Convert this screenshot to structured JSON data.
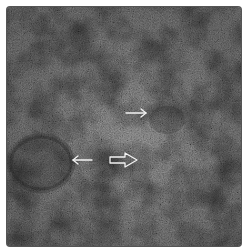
{
  "image": {
    "kind": "grayscale micrograph",
    "texture": "dense granular noise",
    "colors": {
      "background": "#ffffff",
      "base_gray": "#6f6f6f",
      "dark_region": "#3e3e3e",
      "light_region": "#8a8a8a",
      "arrow": "#f2f2f2"
    }
  },
  "annotations": {
    "arrows": [
      {
        "name": "arrow-right-upper",
        "type": "thin",
        "direction": "right",
        "from": [
          126,
          113
        ],
        "to": [
          146,
          113
        ]
      },
      {
        "name": "arrow-left-lower",
        "type": "thin",
        "direction": "left",
        "from": [
          92,
          160
        ],
        "to": [
          73,
          160
        ]
      },
      {
        "name": "arrow-right-hollow",
        "type": "hollow",
        "direction": "right",
        "from": [
          110,
          160
        ],
        "to": [
          137,
          160
        ]
      }
    ]
  }
}
